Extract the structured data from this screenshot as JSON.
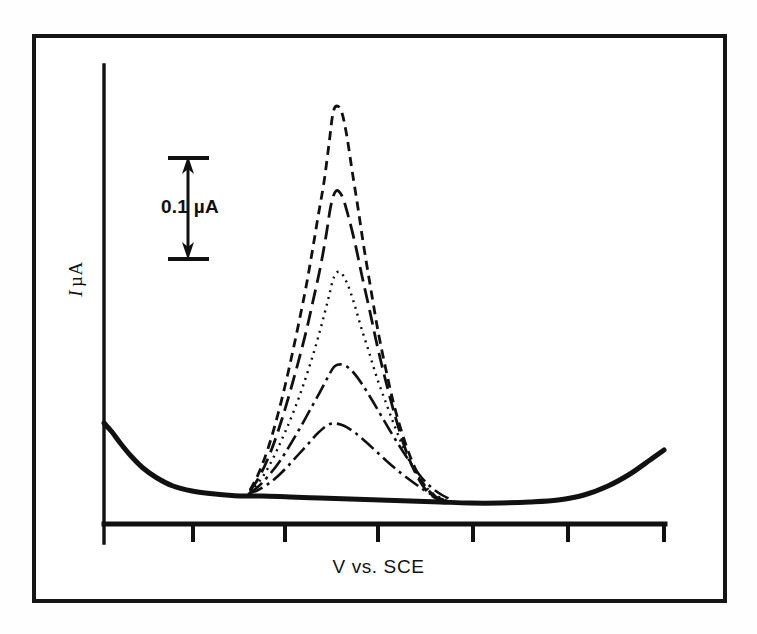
{
  "figure": {
    "y_axis_label_symbol": "I",
    "y_axis_label_unit": "µA",
    "x_axis_label": "V vs. SCE",
    "scale_bar_label": "0.1 µA",
    "frame_color": "#151515",
    "trace_color": "#111111",
    "background_color": "#ffffff"
  },
  "chart_data": {
    "type": "line",
    "title": "",
    "subtitle": "",
    "xlabel": "V vs. SCE",
    "ylabel": "I µA",
    "grid": false,
    "legend_position": "none",
    "annotations": [
      {
        "name": "scale-bar",
        "text": "0.1 µA",
        "kind": "double-headed-vertical-arrow",
        "value": 0.1,
        "unit": "µA",
        "x_px": 188,
        "y_top_px": 158,
        "y_bottom_px": 258
      }
    ],
    "axes": {
      "x_axis_px": {
        "x_start": 104,
        "x_end": 665,
        "y": 524
      },
      "y_axis_px": {
        "x": 104,
        "y_top": 65,
        "y_bottom": 543
      },
      "x_tick_positions_px": [
        193,
        285,
        378,
        473,
        568
      ],
      "x_tick_count": 5,
      "x_tick_labels": [],
      "y_tick_labels": [],
      "xlim_px": [
        104,
        665
      ],
      "ylim_px": [
        524,
        65
      ]
    },
    "series": [
      {
        "name": "baseline",
        "style": "solid",
        "linewidth": 5,
        "peak_height_uA": 0.0,
        "peak_x_px": null,
        "points_px": [
          [
            104,
            423
          ],
          [
            112,
            432
          ],
          [
            121,
            444
          ],
          [
            131,
            456
          ],
          [
            143,
            468
          ],
          [
            157,
            478
          ],
          [
            173,
            486
          ],
          [
            192,
            491
          ],
          [
            215,
            494
          ],
          [
            240,
            496
          ],
          [
            262,
            496
          ],
          [
            290,
            497
          ],
          [
            320,
            498
          ],
          [
            350,
            499
          ],
          [
            380,
            500
          ],
          [
            410,
            501
          ],
          [
            440,
            502
          ],
          [
            470,
            503
          ],
          [
            500,
            503
          ],
          [
            530,
            502
          ],
          [
            558,
            500
          ],
          [
            584,
            495
          ],
          [
            608,
            486
          ],
          [
            630,
            474
          ],
          [
            650,
            460
          ],
          [
            664,
            450
          ]
        ]
      },
      {
        "name": "trace-5-lowest",
        "style": "dashdot",
        "linewidth": 2.6,
        "peak_height_uA": 0.08,
        "peak_x_px": 330,
        "points_px": [
          [
            248,
            494
          ],
          [
            258,
            490
          ],
          [
            268,
            484
          ],
          [
            278,
            476
          ],
          [
            288,
            466
          ],
          [
            298,
            455
          ],
          [
            308,
            444
          ],
          [
            318,
            433
          ],
          [
            330,
            424
          ],
          [
            342,
            425
          ],
          [
            354,
            432
          ],
          [
            366,
            442
          ],
          [
            378,
            453
          ],
          [
            390,
            464
          ],
          [
            402,
            474
          ],
          [
            414,
            483
          ],
          [
            424,
            490
          ],
          [
            434,
            496
          ],
          [
            444,
            500
          ]
        ]
      },
      {
        "name": "trace-4",
        "style": "dashdot",
        "linewidth": 2.6,
        "peak_height_uA": 0.15,
        "peak_x_px": 335,
        "points_px": [
          [
            250,
            493
          ],
          [
            260,
            485
          ],
          [
            270,
            474
          ],
          [
            280,
            461
          ],
          [
            290,
            445
          ],
          [
            300,
            428
          ],
          [
            310,
            410
          ],
          [
            320,
            392
          ],
          [
            328,
            377
          ],
          [
            335,
            366
          ],
          [
            344,
            365
          ],
          [
            353,
            372
          ],
          [
            362,
            384
          ],
          [
            372,
            400
          ],
          [
            382,
            417
          ],
          [
            392,
            434
          ],
          [
            402,
            450
          ],
          [
            412,
            465
          ],
          [
            422,
            478
          ],
          [
            432,
            488
          ],
          [
            442,
            495
          ],
          [
            452,
            500
          ]
        ]
      },
      {
        "name": "trace-3",
        "style": "dotted",
        "linewidth": 2.4,
        "peak_height_uA": 0.24,
        "peak_x_px": 334,
        "points_px": [
          [
            250,
            492
          ],
          [
            259,
            482
          ],
          [
            268,
            468
          ],
          [
            277,
            450
          ],
          [
            286,
            430
          ],
          [
            295,
            408
          ],
          [
            304,
            383
          ],
          [
            313,
            355
          ],
          [
            321,
            327
          ],
          [
            328,
            300
          ],
          [
            334,
            277
          ],
          [
            340,
            272
          ],
          [
            347,
            283
          ],
          [
            354,
            303
          ],
          [
            361,
            327
          ],
          [
            369,
            352
          ],
          [
            377,
            378
          ],
          [
            386,
            403
          ],
          [
            395,
            427
          ],
          [
            404,
            449
          ],
          [
            413,
            468
          ],
          [
            422,
            482
          ],
          [
            431,
            492
          ],
          [
            441,
            498
          ],
          [
            451,
            502
          ]
        ]
      },
      {
        "name": "trace-2",
        "style": "longdash",
        "linewidth": 2.8,
        "peak_height_uA": 0.33,
        "peak_x_px": 333,
        "points_px": [
          [
            250,
            491
          ],
          [
            258,
            479
          ],
          [
            266,
            463
          ],
          [
            274,
            443
          ],
          [
            282,
            419
          ],
          [
            290,
            392
          ],
          [
            298,
            363
          ],
          [
            306,
            332
          ],
          [
            313,
            301
          ],
          [
            320,
            269
          ],
          [
            326,
            236
          ],
          [
            331,
            205
          ],
          [
            336,
            191
          ],
          [
            342,
            196
          ],
          [
            348,
            215
          ],
          [
            355,
            243
          ],
          [
            362,
            276
          ],
          [
            370,
            312
          ],
          [
            378,
            349
          ],
          [
            387,
            386
          ],
          [
            396,
            419
          ],
          [
            405,
            448
          ],
          [
            414,
            470
          ],
          [
            423,
            486
          ],
          [
            432,
            496
          ],
          [
            442,
            501
          ]
        ]
      },
      {
        "name": "trace-1-tallest",
        "style": "dashed",
        "linewidth": 2.8,
        "peak_height_uA": 0.42,
        "peak_x_px": 335,
        "points_px": [
          [
            250,
            490
          ],
          [
            257,
            477
          ],
          [
            264,
            460
          ],
          [
            271,
            439
          ],
          [
            278,
            414
          ],
          [
            285,
            386
          ],
          [
            292,
            355
          ],
          [
            299,
            322
          ],
          [
            306,
            287
          ],
          [
            312,
            253
          ],
          [
            318,
            217
          ],
          [
            324,
            182
          ],
          [
            329,
            144
          ],
          [
            333,
            113
          ],
          [
            337,
            106
          ],
          [
            342,
            113
          ],
          [
            347,
            137
          ],
          [
            352,
            170
          ],
          [
            358,
            208
          ],
          [
            364,
            248
          ],
          [
            371,
            290
          ],
          [
            378,
            331
          ],
          [
            386,
            370
          ],
          [
            394,
            405
          ],
          [
            403,
            436
          ],
          [
            412,
            461
          ],
          [
            421,
            480
          ],
          [
            430,
            492
          ],
          [
            440,
            499
          ],
          [
            450,
            503
          ]
        ]
      }
    ]
  }
}
